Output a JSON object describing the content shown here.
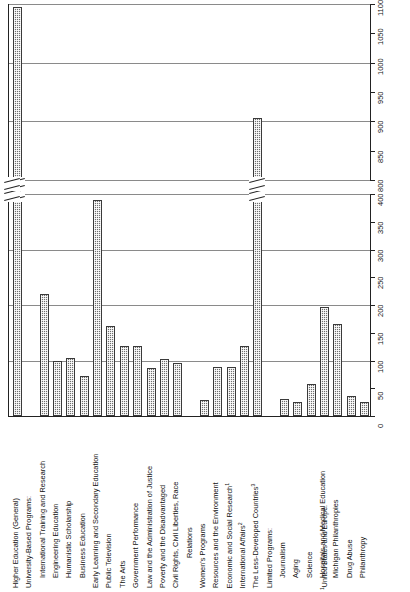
{
  "chart_data": {
    "type": "bar",
    "title": "",
    "xlabel": "",
    "ylabel": "",
    "orientation": "vertical",
    "grid": true,
    "legend": false,
    "axis_break": {
      "lower_max": 400,
      "upper_min": 800
    },
    "ylim_lower": [
      0,
      400
    ],
    "ylim_upper": [
      800,
      1100
    ],
    "ticks_lower": [
      "0",
      "50",
      "100",
      "150",
      "200",
      "250",
      "300",
      "350",
      "400"
    ],
    "ticks_upper": [
      "800",
      "850",
      "900",
      "950",
      "1000",
      "1050",
      "1100"
    ],
    "categories": [
      "Higher Education (General)",
      "University-Based Programs:",
      "International Training and Research",
      "Engineering Education",
      "Humanistic Scholarship",
      "Business Education",
      "Early Learning and Secondary Education",
      "Public Television",
      "The Arts",
      "Government Performance",
      "Law and the Administration of Justice",
      "Poverty and the Disadvantaged",
      "Civil Rights, Civil Liberties, Race Relations",
      "Women's Programs",
      "Resources and the Environment",
      "Economic and Social Research",
      "International Affairs",
      "The Less-Developed Countries",
      "Limited Programs:",
      "Journalism",
      "Aging",
      "Science",
      "Hospitals and Medical Education",
      "Michigan Philanthropies",
      "Drug Abuse",
      "Philanthropy"
    ],
    "values": [
      1095,
      null,
      220,
      100,
      105,
      72,
      390,
      163,
      127,
      126,
      87,
      103,
      95,
      28,
      88,
      88,
      127,
      905,
      null,
      30,
      26,
      57,
      196,
      166,
      36,
      25
    ],
    "footnote_markers": {
      "Economic and Social Research": "1",
      "International Affairs": "2",
      "The Less-Developed Countries": "3"
    }
  },
  "footnote": {
    "marker": "1",
    "text": "United States and Europe."
  },
  "categories_display": [
    {
      "label": "Higher Education (General)",
      "indent": 0,
      "sup": "",
      "value": 1095
    },
    {
      "label": "University-Based Programs:",
      "indent": 0,
      "sup": "",
      "value": null
    },
    {
      "label": "International Training and Research",
      "indent": 1,
      "sup": "",
      "value": 220
    },
    {
      "label": "Engineering Education",
      "indent": 1,
      "sup": "",
      "value": 100
    },
    {
      "label": "Humanistic Scholarship",
      "indent": 1,
      "sup": "",
      "value": 105
    },
    {
      "label": "Business Education",
      "indent": 1,
      "sup": "",
      "value": 72
    },
    {
      "label": "Early Learning and Secondary Education",
      "indent": 0,
      "sup": "",
      "value": 390
    },
    {
      "label": "Public Television",
      "indent": 0,
      "sup": "",
      "value": 163
    },
    {
      "label": "The Arts",
      "indent": 0,
      "sup": "",
      "value": 127
    },
    {
      "label": "Government Performance",
      "indent": 0,
      "sup": "",
      "value": 126
    },
    {
      "label": "Law and the Administration of Justice",
      "indent": 0,
      "sup": "",
      "value": 87
    },
    {
      "label": "Poverty and the Disadvantaged",
      "indent": 0,
      "sup": "",
      "value": 103
    },
    {
      "label": "Civil Rights, Civil Liberties, Race",
      "indent": 0,
      "sup": "",
      "value": 95
    },
    {
      "label": "Relations",
      "indent": 2,
      "sup": "",
      "value": null
    },
    {
      "label": "Women's Programs",
      "indent": 0,
      "sup": "",
      "value": 28
    },
    {
      "label": "Resources and the Environment",
      "indent": 0,
      "sup": "",
      "value": 88
    },
    {
      "label": "Economic and Social Research",
      "indent": 0,
      "sup": "1",
      "value": 88
    },
    {
      "label": "International Affairs",
      "indent": 0,
      "sup": "2",
      "value": 127
    },
    {
      "label": "The Less-Developed Countries",
      "indent": 0,
      "sup": "3",
      "value": 905
    },
    {
      "label": "Limited Programs:",
      "indent": 0,
      "sup": "",
      "value": null
    },
    {
      "label": "Journalism",
      "indent": 1,
      "sup": "",
      "value": 30
    },
    {
      "label": "Aging",
      "indent": 1,
      "sup": "",
      "value": 26
    },
    {
      "label": "Science",
      "indent": 1,
      "sup": "",
      "value": 57
    },
    {
      "label": "Hospitals and Medical Education",
      "indent": 1,
      "sup": "",
      "value": 196
    },
    {
      "label": "Michigan Philanthropies",
      "indent": 1,
      "sup": "",
      "value": 166
    },
    {
      "label": "Drug Abuse",
      "indent": 1,
      "sup": "",
      "value": 36
    },
    {
      "label": "Philanthropy",
      "indent": 1,
      "sup": "",
      "value": 25
    }
  ]
}
